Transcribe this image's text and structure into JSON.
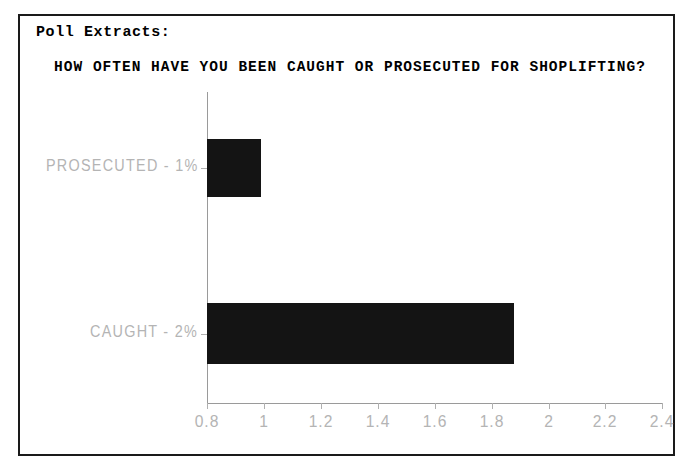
{
  "document": {
    "section_label": "Poll Extracts:",
    "border_color": "#1a1a1a",
    "background_color": "#ffffff"
  },
  "chart_data": {
    "type": "bar",
    "orientation": "horizontal",
    "title": "HOW OFTEN HAVE YOU BEEN CAUGHT OR PROSECUTED FOR SHOPLIFTING?",
    "xlabel": "",
    "ylabel": "",
    "categories": [
      "PROSECUTED - 1%",
      "CAUGHT - 2%"
    ],
    "values": [
      1,
      2
    ],
    "xlim": [
      0.8,
      2.4
    ],
    "xticks": [
      "0.8",
      "1",
      "1.2",
      "1.4",
      "1.6",
      "1.8",
      "2",
      "2.2",
      "2.4"
    ],
    "xtick_values": [
      0.8,
      1,
      1.2,
      1.4,
      1.6,
      1.8,
      2,
      2.2,
      2.4
    ],
    "grid": false,
    "legend": false,
    "bar_color": "#141414",
    "axis_color": "#9a9a9a",
    "tick_label_color": "#b4b4b4",
    "bars": [
      {
        "category": "PROSECUTED - 1%",
        "label": "PROSECUTED - 1%",
        "percent": "1%",
        "value": 1,
        "left_px": 0,
        "top_px": 47,
        "width_px": 54,
        "height_px": 58
      },
      {
        "category": "CAUGHT - 2%",
        "label": "CAUGHT - 2%",
        "percent": "2%",
        "value": 2,
        "left_px": 0,
        "top_px": 211,
        "width_px": 307,
        "height_px": 61
      }
    ],
    "xtick_positions_px": [
      0,
      57,
      114,
      171,
      228,
      285,
      342,
      398,
      455
    ]
  }
}
